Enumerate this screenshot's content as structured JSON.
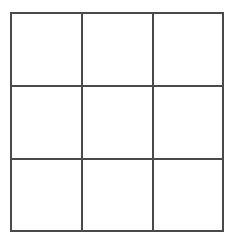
{
  "document": {
    "kind": "grid-diagram",
    "title": "3x3 Grid",
    "background_color": "#ffffff"
  },
  "grid": {
    "rows": 3,
    "columns": 3,
    "line_color": "#4a4a4a",
    "line_width_px": 2,
    "cell_fill_color": "#ffffff",
    "frame": {
      "left_px": 10,
      "top_px": 12,
      "width_px": 212,
      "height_px": 218
    },
    "vertical_divider_x_px": [
      81,
      152
    ],
    "horizontal_divider_y_px": [
      85,
      158
    ],
    "cells": [
      [
        {
          "id": "cell-r1c1",
          "value": ""
        },
        {
          "id": "cell-r1c2",
          "value": ""
        },
        {
          "id": "cell-r1c3",
          "value": ""
        }
      ],
      [
        {
          "id": "cell-r2c1",
          "value": ""
        },
        {
          "id": "cell-r2c2",
          "value": ""
        },
        {
          "id": "cell-r2c3",
          "value": ""
        }
      ],
      [
        {
          "id": "cell-r3c1",
          "value": ""
        },
        {
          "id": "cell-r3c2",
          "value": ""
        },
        {
          "id": "cell-r3c3",
          "value": ""
        }
      ]
    ]
  },
  "artifacts": {
    "scan_speck_color": "#f2f2f2"
  }
}
